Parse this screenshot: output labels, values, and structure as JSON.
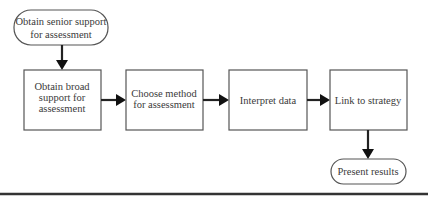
{
  "diagram": {
    "type": "flowchart",
    "nodes": [
      {
        "id": "start",
        "shape": "terminal",
        "lines": [
          "Obtain senior support",
          "for assessment"
        ]
      },
      {
        "id": "broad",
        "shape": "process",
        "lines": [
          "Obtain broad",
          "support for",
          "assessment"
        ]
      },
      {
        "id": "method",
        "shape": "process",
        "lines": [
          "Choose method",
          "for assessment"
        ]
      },
      {
        "id": "interpret",
        "shape": "process",
        "lines": [
          "Interpret data"
        ]
      },
      {
        "id": "link",
        "shape": "process",
        "lines": [
          "Link to strategy"
        ]
      },
      {
        "id": "present",
        "shape": "terminal",
        "lines": [
          "Present results"
        ]
      }
    ],
    "edges": [
      {
        "from": "start",
        "to": "broad"
      },
      {
        "from": "broad",
        "to": "method"
      },
      {
        "from": "method",
        "to": "interpret"
      },
      {
        "from": "interpret",
        "to": "link"
      },
      {
        "from": "link",
        "to": "present"
      }
    ]
  }
}
